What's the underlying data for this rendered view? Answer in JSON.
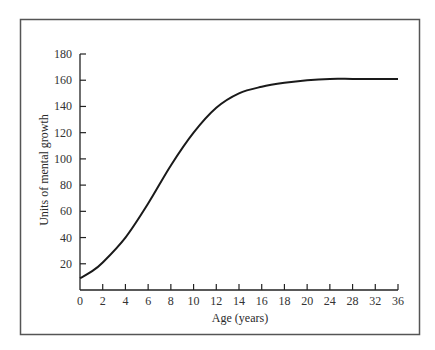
{
  "chart_data": {
    "type": "line",
    "title": "",
    "xlabel": "Age (years)",
    "ylabel": "Units of mental growth",
    "x_ticks": [
      0,
      2,
      4,
      6,
      8,
      10,
      12,
      14,
      16,
      18,
      20,
      24,
      28,
      32,
      36
    ],
    "x_tick_note": "Ticks are evenly spaced on screen; scale is compressed after age 20 (steps of 4 years).",
    "y_ticks": [
      20,
      40,
      60,
      80,
      100,
      120,
      140,
      160,
      180
    ],
    "ylim": [
      0,
      180
    ],
    "xlim": [
      0,
      36
    ],
    "grid": false,
    "legend": null,
    "series": [
      {
        "name": "Mental growth",
        "x": [
          0,
          1,
          2,
          4,
          6,
          8,
          10,
          12,
          14,
          16,
          18,
          20,
          24,
          28,
          32,
          36
        ],
        "values": [
          9,
          14,
          21,
          40,
          66,
          95,
          120,
          139,
          150,
          155,
          158,
          160,
          161,
          161,
          161,
          161
        ]
      }
    ]
  },
  "frame": {
    "border_color": "#555555"
  },
  "corner_mark": ")"
}
